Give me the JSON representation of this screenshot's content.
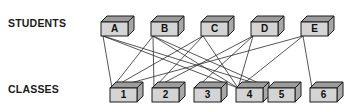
{
  "diagram": {
    "row_labels": {
      "top": "STUDENTS",
      "bottom": "CLASSES"
    },
    "colors": {
      "node_face": "#d4d4d4",
      "node_top": "#9c9c9c",
      "node_side": "#a8a8a8",
      "outline": "#1c1c1c",
      "edge": "#2b2b2b",
      "text": "#101010",
      "background": "#ffffff"
    },
    "students": [
      {
        "id": "A",
        "label": "A",
        "x": 101,
        "y": 22
      },
      {
        "id": "B",
        "label": "B",
        "x": 151,
        "y": 22
      },
      {
        "id": "C",
        "label": "C",
        "x": 201,
        "y": 22
      },
      {
        "id": "D",
        "label": "D",
        "x": 251,
        "y": 22
      },
      {
        "id": "E",
        "label": "E",
        "x": 301,
        "y": 22
      }
    ],
    "classes": [
      {
        "id": "1",
        "label": "1",
        "x": 110,
        "y": 88
      },
      {
        "id": "2",
        "label": "2",
        "x": 152,
        "y": 88
      },
      {
        "id": "3",
        "label": "3",
        "x": 194,
        "y": 88
      },
      {
        "id": "4",
        "label": "4",
        "x": 236,
        "y": 88
      },
      {
        "id": "5",
        "label": "5",
        "x": 268,
        "y": 88
      },
      {
        "id": "6",
        "label": "6",
        "x": 310,
        "y": 88
      }
    ],
    "edges": [
      {
        "from": "A",
        "to": "1"
      },
      {
        "from": "A",
        "to": "4"
      },
      {
        "from": "A",
        "to": "5"
      },
      {
        "from": "B",
        "to": "1"
      },
      {
        "from": "B",
        "to": "2"
      },
      {
        "from": "B",
        "to": "4"
      },
      {
        "from": "B",
        "to": "5"
      },
      {
        "from": "C",
        "to": "1"
      },
      {
        "from": "C",
        "to": "2"
      },
      {
        "from": "C",
        "to": "4"
      },
      {
        "from": "D",
        "to": "2"
      },
      {
        "from": "D",
        "to": "3"
      },
      {
        "from": "D",
        "to": "4"
      },
      {
        "from": "E",
        "to": "1"
      },
      {
        "from": "E",
        "to": "4"
      },
      {
        "from": "E",
        "to": "6"
      }
    ],
    "node_geometry": {
      "face_width": 27,
      "face_height": 14,
      "depth_x": 6,
      "depth_y": 6
    }
  }
}
